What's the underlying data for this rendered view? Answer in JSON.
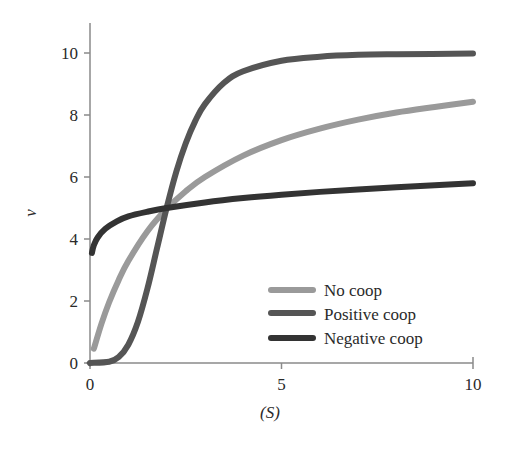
{
  "chart_data": {
    "type": "line",
    "title": "",
    "xlabel": "(S)",
    "ylabel": "v",
    "xlim": [
      0,
      10
    ],
    "ylim": [
      0,
      10.8
    ],
    "xticks": [
      0,
      5,
      10
    ],
    "yticks": [
      0,
      2,
      4,
      6,
      8,
      10
    ],
    "grid": false,
    "legend_position": "lower right",
    "series": [
      {
        "name": "No coop",
        "color": "#9a9a9a",
        "x": [
          0.1,
          0.3,
          0.5,
          0.75,
          1,
          1.5,
          2,
          2.5,
          3,
          4,
          5,
          6,
          7,
          8,
          9,
          10
        ],
        "y": [
          0.46,
          1.27,
          1.96,
          2.68,
          3.29,
          4.25,
          4.97,
          5.54,
          6.0,
          6.69,
          7.19,
          7.56,
          7.85,
          8.08,
          8.26,
          8.43
        ]
      },
      {
        "name": "Positive coop",
        "color": "#555555",
        "x": [
          0,
          0.5,
          0.75,
          1,
          1.25,
          1.5,
          1.75,
          2,
          2.25,
          2.5,
          2.75,
          3,
          3.5,
          4,
          5,
          6,
          7,
          8,
          10
        ],
        "y": [
          0,
          0.04,
          0.19,
          0.59,
          1.32,
          2.4,
          3.7,
          5.0,
          6.16,
          7.09,
          7.81,
          8.35,
          9.04,
          9.41,
          9.75,
          9.88,
          9.94,
          9.96,
          9.98
        ]
      },
      {
        "name": "Negative coop",
        "color": "#333333",
        "x": [
          0.05,
          0.1,
          0.2,
          0.4,
          0.7,
          1,
          1.5,
          2,
          3,
          4,
          5,
          6,
          7,
          8,
          9,
          10
        ],
        "y": [
          3.55,
          3.8,
          4.05,
          4.33,
          4.57,
          4.73,
          4.88,
          5.0,
          5.18,
          5.32,
          5.43,
          5.52,
          5.6,
          5.67,
          5.73,
          5.8
        ]
      }
    ]
  },
  "legend": {
    "items": [
      {
        "label": "No coop",
        "color": "#9a9a9a"
      },
      {
        "label": "Positive coop",
        "color": "#555555"
      },
      {
        "label": "Negative coop",
        "color": "#333333"
      }
    ]
  },
  "axes": {
    "x_label": "(S)",
    "y_label": "ν",
    "x_ticks": [
      "0",
      "5",
      "10"
    ],
    "y_ticks": [
      "0",
      "2",
      "4",
      "6",
      "8",
      "10"
    ]
  }
}
